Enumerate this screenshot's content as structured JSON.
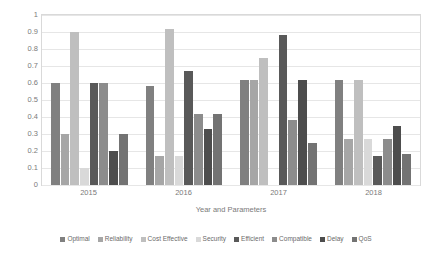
{
  "chart_data": {
    "type": "bar",
    "title": "",
    "xlabel": "Year and Parameters",
    "ylabel": "Average No. of Parameter",
    "categories": [
      "2015",
      "2016",
      "2017",
      "2018"
    ],
    "ylim": [
      0,
      1
    ],
    "ytick_labels": [
      "0",
      "0.1",
      "0.2",
      "0.3",
      "0.4",
      "0.5",
      "0.6",
      "0.7",
      "0.8",
      "0.9",
      "1"
    ],
    "ytick_values": [
      0,
      0.1,
      0.2,
      0.3,
      0.4,
      0.5,
      0.6,
      0.7,
      0.8,
      0.9,
      1
    ],
    "grid": true,
    "legend_position": "bottom",
    "series": [
      {
        "name": "Optimal",
        "color": "#808080",
        "values": [
          0.6,
          0.585,
          0.62,
          0.62
        ]
      },
      {
        "name": "Reliability",
        "color": "#a6a6a6",
        "values": [
          0.3,
          0.17,
          0.62,
          0.27
        ]
      },
      {
        "name": "Cost Effective",
        "color": "#bfbfbf",
        "values": [
          0.9,
          0.92,
          0.75,
          0.62
        ]
      },
      {
        "name": "Security",
        "color": "#d9d9d9",
        "values": [
          0.1,
          0.17,
          0.0,
          0.27
        ]
      },
      {
        "name": "Efficient",
        "color": "#595959",
        "values": [
          0.6,
          0.67,
          0.88,
          0.17
        ]
      },
      {
        "name": "Compatible",
        "color": "#8c8c8c",
        "values": [
          0.6,
          0.42,
          0.38,
          0.27
        ]
      },
      {
        "name": "Delay",
        "color": "#4d4d4d",
        "values": [
          0.2,
          0.33,
          0.62,
          0.35
        ]
      },
      {
        "name": "QoS",
        "color": "#737373",
        "values": [
          0.3,
          0.42,
          0.25,
          0.18
        ]
      }
    ]
  }
}
